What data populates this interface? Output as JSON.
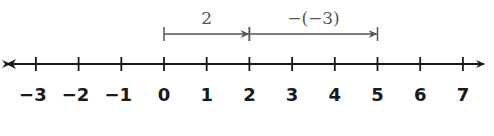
{
  "chart_data": {
    "type": "number_line",
    "title": "",
    "range": [
      -3,
      7
    ],
    "ticks": [
      -3,
      -2,
      -1,
      0,
      1,
      2,
      3,
      4,
      5,
      6,
      7
    ],
    "tick_labels": [
      "−3",
      "−2",
      "−1",
      "0",
      "1",
      "2",
      "3",
      "4",
      "5",
      "6",
      "7"
    ],
    "arrows_both_ends": true,
    "jumps": [
      {
        "from": 0,
        "to": 2,
        "label": "2"
      },
      {
        "from": 2,
        "to": 5,
        "label": "−(−3)"
      }
    ]
  },
  "colors": {
    "axis": "#1a1a1a",
    "jump": "#555555"
  }
}
